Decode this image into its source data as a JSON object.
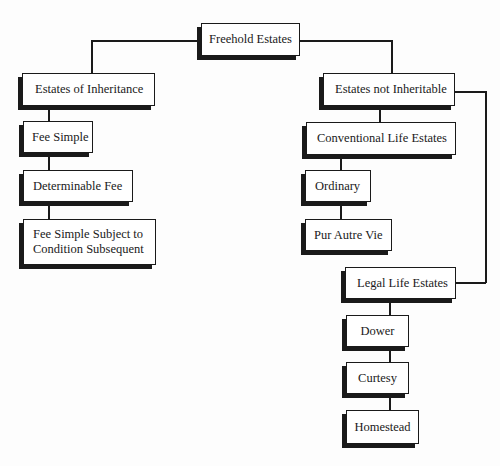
{
  "diagram": {
    "title": "Freehold Estates",
    "colors": {
      "line": "#1a1a1a",
      "box_fill": "#ffffff",
      "shadow": "#1a1a1a"
    },
    "nodes": {
      "root": "Freehold Estates",
      "inheritance": "Estates of Inheritance",
      "fee_simple": "Fee Simple",
      "determinable_fee": "Determinable Fee",
      "fee_simple_subject": "Fee Simple Subject to\nCondition Subsequent",
      "not_inheritable": "Estates not Inheritable",
      "conventional": "Conventional Life Estates",
      "ordinary": "Ordinary",
      "pur_autre_vie": "Pur Autre Vie",
      "legal": "Legal Life Estates",
      "dower": "Dower",
      "curtesy": "Curtesy",
      "homestead": "Homestead"
    },
    "edges": [
      [
        "root",
        "inheritance"
      ],
      [
        "root",
        "not_inheritable"
      ],
      [
        "inheritance",
        "fee_simple"
      ],
      [
        "fee_simple",
        "determinable_fee"
      ],
      [
        "determinable_fee",
        "fee_simple_subject"
      ],
      [
        "not_inheritable",
        "conventional"
      ],
      [
        "conventional",
        "ordinary"
      ],
      [
        "ordinary",
        "pur_autre_vie"
      ],
      [
        "not_inheritable",
        "legal"
      ],
      [
        "legal",
        "dower"
      ],
      [
        "dower",
        "curtesy"
      ],
      [
        "curtesy",
        "homestead"
      ]
    ]
  }
}
